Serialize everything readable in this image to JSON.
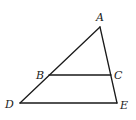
{
  "figure": {
    "type": "triangle-with-parallel-segment",
    "points": {
      "A": {
        "label": "A"
      },
      "B": {
        "label": "B"
      },
      "C": {
        "label": "C"
      },
      "D": {
        "label": "D"
      },
      "E": {
        "label": "E"
      }
    },
    "segments": [
      {
        "id": "AD",
        "from": "A",
        "to": "D"
      },
      {
        "id": "AE",
        "from": "A",
        "to": "E"
      },
      {
        "id": "DE",
        "from": "D",
        "to": "E"
      },
      {
        "id": "BC",
        "from": "B",
        "to": "C"
      }
    ],
    "color": "#1a1a1a"
  }
}
